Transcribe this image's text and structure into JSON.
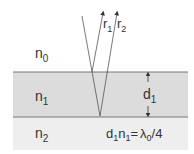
{
  "diagram": {
    "media": [
      {
        "id": "n0",
        "label": "n",
        "sub": "0",
        "fill": "#ffffff"
      },
      {
        "id": "n1",
        "label": "n",
        "sub": "1",
        "fill": "#dcdcdc"
      },
      {
        "id": "n2",
        "label": "n",
        "sub": "2",
        "fill": "#eeeeee"
      }
    ],
    "rays": [
      {
        "label": "r",
        "sub": "1"
      },
      {
        "label": "r",
        "sub": "2"
      }
    ],
    "thickness": {
      "label": "d",
      "sub": "1"
    },
    "equation": {
      "d": "d",
      "d_sub": "1",
      "n": "n",
      "n_sub": "1",
      "eq": "=",
      "lambda": "λ",
      "lambda_sub": "0",
      "rest": "/4"
    },
    "colors": {
      "line": "#555555",
      "layer": "#dcdcdc",
      "substrate": "#eeeeee"
    }
  }
}
